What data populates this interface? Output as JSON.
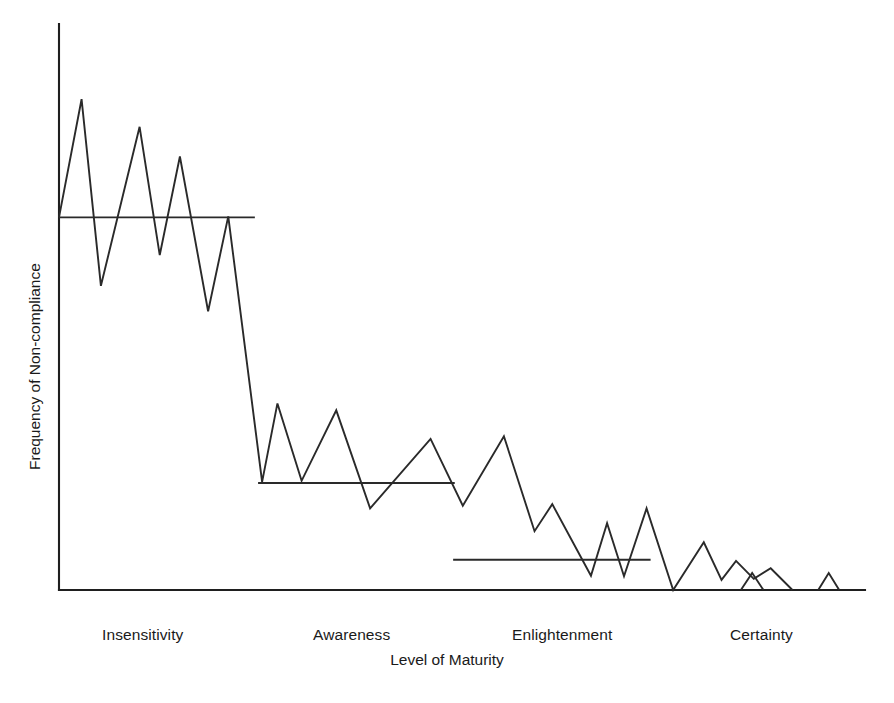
{
  "chart_data": {
    "type": "line",
    "title": "",
    "xlabel": "Level of Maturity",
    "ylabel": "Frequency of Non-compliance",
    "grid": false,
    "legend": null,
    "axis_ticks_shown": false,
    "categories": [
      "Insensitivity",
      "Awareness",
      "Enlightenment",
      "Certainty"
    ],
    "xlim": [
      0,
      100
    ],
    "ylim": [
      0,
      100
    ],
    "series": [
      {
        "name": "Frequency of Non-compliance",
        "style": "zigzag",
        "points": [
          {
            "x": 0.0,
            "y": 70.3
          },
          {
            "x": 2.8,
            "y": 92.6
          },
          {
            "x": 5.2,
            "y": 57.4
          },
          {
            "x": 10.0,
            "y": 87.4
          },
          {
            "x": 12.5,
            "y": 63.2
          },
          {
            "x": 15.0,
            "y": 81.8
          },
          {
            "x": 18.5,
            "y": 52.6
          },
          {
            "x": 21.0,
            "y": 70.5
          },
          {
            "x": 25.2,
            "y": 20.4
          },
          {
            "x": 27.1,
            "y": 35.2
          },
          {
            "x": 30.1,
            "y": 20.6
          },
          {
            "x": 34.4,
            "y": 33.9
          },
          {
            "x": 38.6,
            "y": 15.4
          },
          {
            "x": 46.1,
            "y": 28.5
          },
          {
            "x": 50.1,
            "y": 15.9
          },
          {
            "x": 55.2,
            "y": 29.0
          },
          {
            "x": 59.0,
            "y": 11.1
          },
          {
            "x": 61.2,
            "y": 16.2
          },
          {
            "x": 66.0,
            "y": 2.7
          },
          {
            "x": 68.0,
            "y": 12.6
          },
          {
            "x": 70.1,
            "y": 2.6
          },
          {
            "x": 72.9,
            "y": 15.4
          },
          {
            "x": 76.2,
            "y": 0.0
          },
          {
            "x": 80.0,
            "y": 9.0
          },
          {
            "x": 82.2,
            "y": 1.9
          },
          {
            "x": 84.0,
            "y": 5.5
          },
          {
            "x": 86.2,
            "y": 2.1
          },
          {
            "x": 88.3,
            "y": 4.1
          },
          {
            "x": 91.0,
            "y": 0.0
          }
        ]
      },
      {
        "name": "Insensitivity mean level",
        "style": "horizontal-mean",
        "stage": "Insensitivity",
        "y": 70.3,
        "x_start": 0.0,
        "x_end": 24.3
      },
      {
        "name": "Awareness mean level",
        "style": "horizontal-mean",
        "stage": "Awareness",
        "y": 20.2,
        "x_start": 24.7,
        "x_end": 49.1
      },
      {
        "name": "Enlightenment mean level",
        "style": "horizontal-mean",
        "stage": "Enlightenment",
        "y": 5.7,
        "x_start": 48.9,
        "x_end": 73.4
      },
      {
        "name": "Certainty spikes",
        "style": "isolated-spikes",
        "stage": "Certainty",
        "spikes": [
          {
            "x_left": 84.6,
            "x_apex": 86.0,
            "x_right": 87.4,
            "y_apex": 3.2
          },
          {
            "x_left": 94.2,
            "x_apex": 95.5,
            "x_right": 96.8,
            "y_apex": 3.2
          }
        ]
      }
    ]
  },
  "labels": {
    "ylabel": "Frequency of Non-compliance",
    "xlabel": "Level of Maturity",
    "categories": [
      {
        "name": "Insensitivity",
        "center_x": 163
      },
      {
        "name": "Awareness",
        "center_x": 369
      },
      {
        "name": "Enlightenment",
        "center_x": 578
      },
      {
        "name": "Certainty",
        "center_x": 782
      }
    ]
  },
  "colors": {
    "background": "#ffffff",
    "line": "#2a2a2a",
    "axis": "#1f1f1f",
    "text": "#1a1a1a"
  }
}
